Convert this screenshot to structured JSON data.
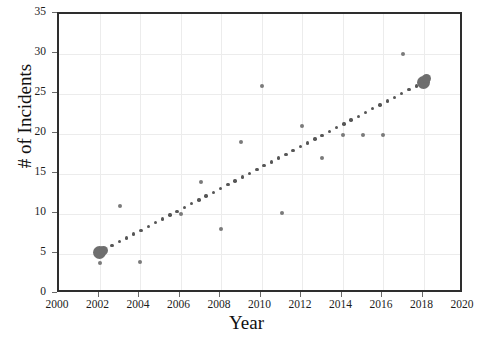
{
  "chart_data": {
    "type": "scatter",
    "title": "",
    "xlabel": "Year",
    "ylabel": "# of Incidents",
    "xlim": [
      2000,
      2020
    ],
    "ylim": [
      0,
      35
    ],
    "xticks": [
      2000,
      2002,
      2004,
      2006,
      2008,
      2010,
      2012,
      2014,
      2016,
      2018,
      2020
    ],
    "yticks": [
      0,
      5,
      10,
      15,
      20,
      25,
      30,
      35
    ],
    "grid": true,
    "legend": "none",
    "marker_color": "#7a7a7a",
    "trendline_color": "#565656",
    "axis_color": "#2e2e2e",
    "grid_color": "#ececec",
    "points": [
      {
        "x": 2002,
        "y": 5.2,
        "size": "cluster"
      },
      {
        "x": 2002.2,
        "y": 5.4,
        "size": "cluster-b"
      },
      {
        "x": 2002,
        "y": 3.9,
        "size": "small"
      },
      {
        "x": 2003,
        "y": 11.0,
        "size": "small"
      },
      {
        "x": 2004,
        "y": 4.0,
        "size": "small"
      },
      {
        "x": 2006,
        "y": 10.0,
        "size": "small"
      },
      {
        "x": 2007,
        "y": 14.0,
        "size": "small"
      },
      {
        "x": 2008,
        "y": 8.1,
        "size": "small"
      },
      {
        "x": 2009,
        "y": 19.0,
        "size": "small"
      },
      {
        "x": 2010,
        "y": 26.0,
        "size": "small"
      },
      {
        "x": 2011,
        "y": 10.1,
        "size": "small"
      },
      {
        "x": 2012,
        "y": 21.0,
        "size": "small"
      },
      {
        "x": 2013,
        "y": 17.0,
        "size": "small"
      },
      {
        "x": 2014,
        "y": 19.9,
        "size": "small"
      },
      {
        "x": 2015,
        "y": 19.9,
        "size": "small"
      },
      {
        "x": 2016,
        "y": 19.9,
        "size": "small"
      },
      {
        "x": 2017,
        "y": 30.0,
        "size": "small"
      },
      {
        "x": 2018,
        "y": 26.4,
        "size": "cluster"
      },
      {
        "x": 2018.15,
        "y": 26.9,
        "size": "cluster-b"
      }
    ],
    "trendline": {
      "style": "dotted",
      "x_start": 2001.9,
      "y_start": 5.1,
      "x_end": 2018.0,
      "y_end": 26.5,
      "dot_count": 46
    }
  }
}
